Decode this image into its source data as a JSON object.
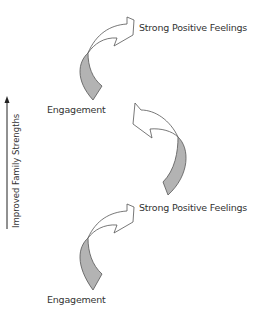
{
  "diagram": {
    "axis": {
      "label": "Improved Family Strengths",
      "direction": "up"
    },
    "labels": {
      "top_positive": "Strong Positive Feelings",
      "top_engagement": "Engagement",
      "bottom_positive": "Strong Positive Feelings",
      "bottom_engagement": "Engagement"
    },
    "colors": {
      "tail_fill": "#b3b3b3",
      "head_fill": "#ffffff",
      "stroke": "#555555",
      "text": "#333333"
    }
  }
}
